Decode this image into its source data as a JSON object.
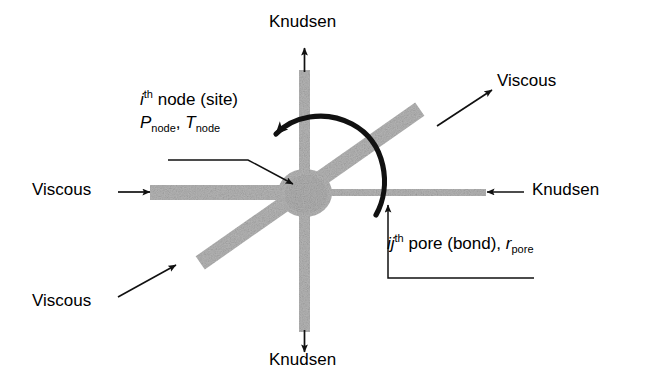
{
  "figure": {
    "type": "pore-network-node-schematic",
    "background_color": "#ffffff",
    "bar_color": "#b5b5b5",
    "ink_color": "#000000"
  },
  "flow_labels": [
    {
      "id": "knudsen-top",
      "text": "Knudsen",
      "direction": "up",
      "regime": "Knudsen"
    },
    {
      "id": "viscous-top-right",
      "text": "Viscous",
      "direction": "up-right",
      "regime": "Viscous"
    },
    {
      "id": "knudsen-right",
      "text": "Knudsen",
      "direction": "left",
      "regime": "Knudsen"
    },
    {
      "id": "viscous-left",
      "text": "Viscous",
      "direction": "right",
      "regime": "Viscous"
    },
    {
      "id": "viscous-bottom-left",
      "text": "Viscous",
      "direction": "up-right",
      "regime": "Viscous"
    },
    {
      "id": "knudsen-bottom",
      "text": "Knudsen",
      "direction": "down",
      "regime": "Knudsen"
    }
  ],
  "annotations": {
    "node": {
      "line1_prefix": "i",
      "line1_sup": "th",
      "line1_rest": " node (site)",
      "line2_sym1": "P",
      "line2_sub1": "node",
      "line2_sep": ", ",
      "line2_sym2": "T",
      "line2_sub2": "node"
    },
    "pore": {
      "prefix": "ij",
      "sup": "th",
      "rest": " pore (bond), ",
      "sym": "r",
      "sub": "pore"
    }
  },
  "elements": {
    "center_node": "central pore node blob",
    "bars": [
      {
        "id": "bar-horizontal-left",
        "regime": "Viscous",
        "orientation": "horizontal",
        "width_px": 15
      },
      {
        "id": "bar-horizontal-right",
        "regime": "Knudsen",
        "orientation": "horizontal",
        "width_px": 7
      },
      {
        "id": "bar-vertical",
        "regime": "Knudsen",
        "orientation": "vertical",
        "width_px": 10
      },
      {
        "id": "bar-diagonal",
        "regime": "Viscous",
        "orientation": "diagonal",
        "width_px": 16
      }
    ],
    "angle_arc": "curved clockwise angle arrow between vertical bar and diagonal bar"
  }
}
